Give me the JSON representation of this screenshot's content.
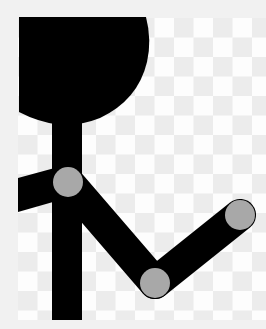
{
  "figure": {
    "colors": {
      "background_border": "#f1f1f1",
      "checker_light": "#fdfdfd",
      "checker_dark": "#ececec",
      "figure": "#000000",
      "joint": "#a8a8a8"
    },
    "checker": {
      "x": 18,
      "y": 18,
      "width": 248,
      "height": 302,
      "cell": 19.5
    },
    "head": {
      "label": "head-shape"
    },
    "joints": [
      {
        "name": "shoulder",
        "cx": 68,
        "cy": 182,
        "r": 15
      },
      {
        "name": "elbow",
        "cx": 155,
        "cy": 283,
        "r": 15
      },
      {
        "name": "hand",
        "cx": 240,
        "cy": 215,
        "r": 15
      }
    ]
  }
}
